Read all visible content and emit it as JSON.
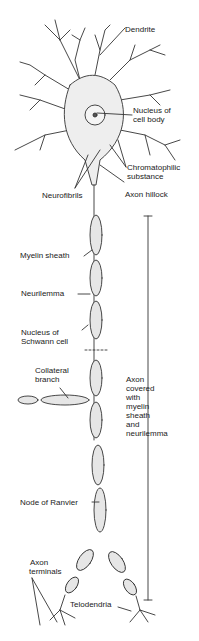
{
  "figure": {
    "labels": {
      "dendrite": "Dendrite",
      "nucleus_cell_body_1": "Nucleus of",
      "nucleus_cell_body_2": "cell body",
      "chromatophilic_1": "Chromatophilic",
      "chromatophilic_2": "substance",
      "neurofibrils": "Neurofibrils",
      "axon_hillock": "Axon hillock",
      "myelin_sheath": "Myelin sheath",
      "neurilemma": "Neurilemma",
      "schwann_1": "Nucleus of",
      "schwann_2": "Schwann cell",
      "collateral_1": "Collateral",
      "collateral_2": "branch",
      "axon_covered": [
        "Axon",
        "covered",
        "with",
        "myelin",
        "sheath",
        "and",
        "neurilemma"
      ],
      "node_of_ranvier": "Node of Ranvier",
      "axon_terminals_1": "Axon",
      "axon_terminals_2": "terminals",
      "telodendria": "Telodendria"
    },
    "colors": {
      "line": "#333333",
      "fill": "#e6e6e6",
      "background": "#ffffff"
    }
  }
}
